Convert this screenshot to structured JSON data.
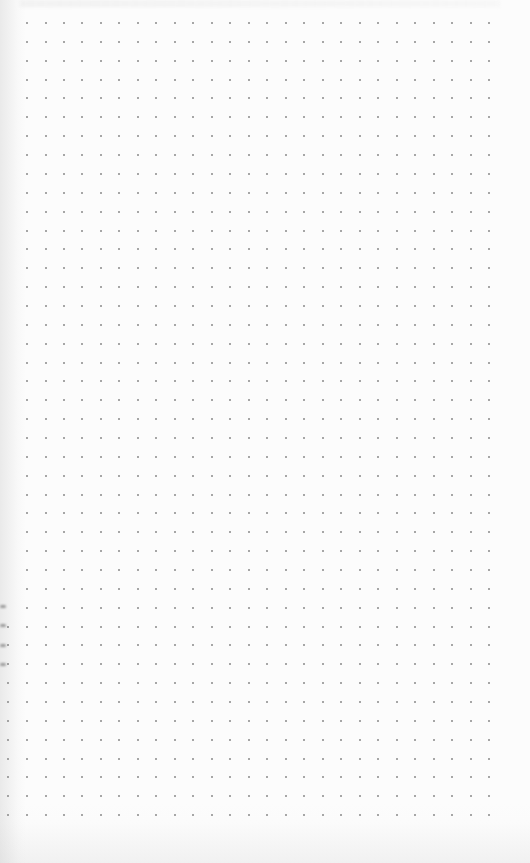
{
  "page": {
    "type": "dot-grid-paper",
    "background_color": "#fcfcfc"
  },
  "grid": {
    "dot_color": "#8a8a8a",
    "dot_size": 2,
    "origin_x": 27,
    "origin_y": 23,
    "spacing_x": 18.48,
    "spacing_y": 18.86,
    "columns": 26,
    "rows": 43,
    "extra_left_column": {
      "x": 8,
      "from_row": 32
    }
  },
  "edge_markers": {
    "color": "#9a9a9a",
    "x": 0,
    "y_positions": [
      606,
      625,
      645,
      664
    ]
  }
}
